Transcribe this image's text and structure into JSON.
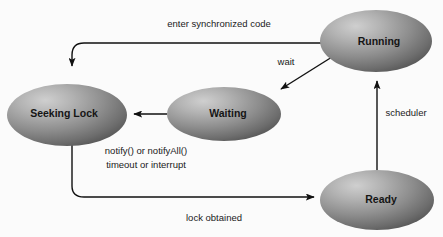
{
  "diagram": {
    "type": "state-diagram",
    "background_color": "#fbfbfb",
    "states": [
      {
        "id": "running",
        "label": "Running",
        "cx": 376,
        "cy": 41,
        "rx": 56,
        "ry": 31
      },
      {
        "id": "seeking-lock",
        "label": "Seeking Lock",
        "cx": 67,
        "cy": 115,
        "rx": 60,
        "ry": 31
      },
      {
        "id": "waiting",
        "label": "Waiting",
        "cx": 224,
        "cy": 114,
        "rx": 57,
        "ry": 27
      },
      {
        "id": "ready",
        "label": "Ready",
        "cx": 377,
        "cy": 200,
        "rx": 57,
        "ry": 30
      }
    ],
    "transitions": [
      {
        "id": "enter-synchronized-code",
        "label": "enter synchronized code",
        "from": "running",
        "to": "seeking-lock",
        "label_x": 219,
        "label_y": 24
      },
      {
        "id": "wait",
        "label": "wait",
        "from": "running",
        "to": "waiting",
        "label_x": 286,
        "label_y": 62
      },
      {
        "id": "notify-or-notifyall",
        "label": "notify() or notifyAll()",
        "from": "waiting",
        "to": "seeking-lock",
        "label_x": 146,
        "label_y": 151
      },
      {
        "id": "timeout-or-interrupt",
        "label": "timeout or interrupt",
        "from": "waiting",
        "to": "seeking-lock",
        "label_x": 146,
        "label_y": 165
      },
      {
        "id": "lock-obtained",
        "label": "lock obtained",
        "from": "seeking-lock",
        "to": "ready",
        "label_x": 214,
        "label_y": 218
      },
      {
        "id": "scheduler",
        "label": "scheduler",
        "from": "ready",
        "to": "running",
        "label_x": 406,
        "label_y": 113
      }
    ],
    "colors": {
      "ellipse_highlight": "#c2c2c2",
      "ellipse_mid": "#8e8e8e",
      "ellipse_edge": "#5b5b5b",
      "line": "#111111",
      "text": "#151515"
    }
  }
}
